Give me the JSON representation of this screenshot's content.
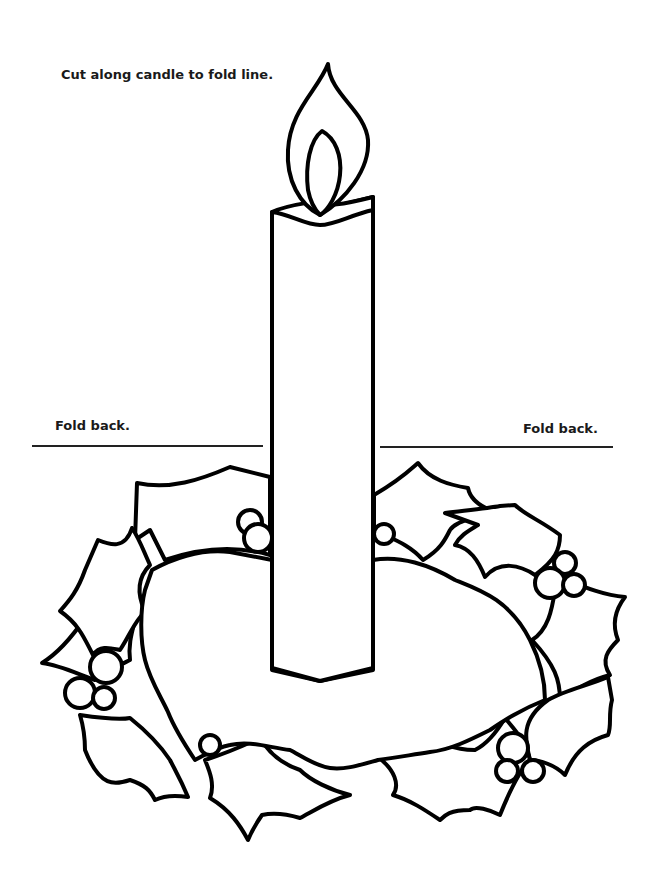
{
  "worksheet": {
    "instruction": "Cut along candle to fold line.",
    "fold_left_label": "Fold back.",
    "fold_right_label": "Fold back."
  },
  "artwork": {
    "subject": "candle with flame inside holly wreath with berries",
    "line_color": "#000000",
    "background_color": "#ffffff"
  }
}
